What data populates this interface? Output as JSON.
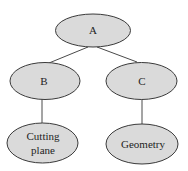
{
  "diagram": {
    "type": "tree",
    "nodes": [
      {
        "id": "A",
        "label": "A",
        "lines": [
          "A"
        ]
      },
      {
        "id": "B",
        "label": "B",
        "lines": [
          "B"
        ]
      },
      {
        "id": "C",
        "label": "C",
        "lines": [
          "C"
        ]
      },
      {
        "id": "cutting-plane",
        "label": "Cutting plane",
        "lines": [
          "Cutting",
          "plane"
        ]
      },
      {
        "id": "geometry",
        "label": "Geometry",
        "lines": [
          "Geometry"
        ]
      }
    ],
    "edges": [
      {
        "from": "A",
        "to": "B"
      },
      {
        "from": "A",
        "to": "C"
      },
      {
        "from": "B",
        "to": "cutting-plane"
      },
      {
        "from": "C",
        "to": "geometry"
      }
    ],
    "colors": {
      "node_fill": "#dadada",
      "node_stroke": "#3a3a3a",
      "edge": "#4a4a4a",
      "text": "#1e1e1e"
    }
  }
}
